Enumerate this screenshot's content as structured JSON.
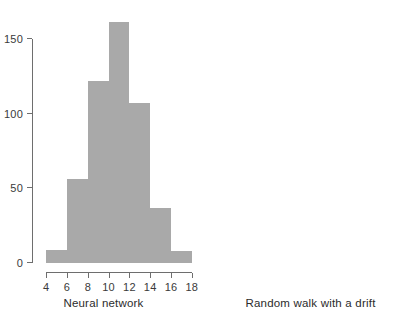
{
  "figure": {
    "background": "#ffffff",
    "bar_color": "#a9a9a9",
    "axis_color": "#6e6e6e",
    "text_color": "#2b2b2b"
  },
  "chart_data": [
    {
      "type": "bar",
      "title": "",
      "xlabel": "Neural network",
      "ylabel": "",
      "panel": "left",
      "xlim": [
        3.4,
        18.6
      ],
      "ylim": [
        0,
        168
      ],
      "grid": false,
      "legend": null,
      "xticks": [
        4,
        6,
        8,
        10,
        12,
        14,
        16,
        18
      ],
      "xtick_labels": [
        "4",
        "6",
        "8",
        "10",
        "12",
        "14",
        "16",
        "18"
      ],
      "yticks": [
        0,
        50,
        100,
        150
      ],
      "ytick_labels": [
        "0",
        "50",
        "100",
        "150"
      ],
      "bin_edges": [
        4,
        6,
        8,
        10,
        12,
        14,
        16,
        18
      ],
      "categories": [
        "4-6",
        "6-8",
        "8-10",
        "10-12",
        "12-14",
        "14-16",
        "16-18"
      ],
      "values": [
        9,
        56,
        122,
        161,
        107,
        37,
        8
      ]
    },
    {
      "type": "bar",
      "title": "",
      "xlabel": "Random walk with a drift",
      "ylabel": "",
      "panel": "right",
      "xlim": [
        4.6,
        17.4
      ],
      "ylim": [
        0,
        128
      ],
      "grid": false,
      "legend": null,
      "xticks": [
        6,
        8,
        10,
        12,
        14,
        16
      ],
      "xtick_labels": [
        "6",
        "8",
        "10",
        "12",
        "14",
        "16"
      ],
      "yticks": [
        0,
        20,
        40,
        60,
        80,
        100,
        120
      ],
      "ytick_labels": [
        "0",
        "20",
        "40",
        "60",
        "80",
        "100",
        "120"
      ],
      "bin_edges": [
        5,
        6,
        7,
        8,
        9,
        10,
        11,
        12,
        13,
        14,
        15,
        16,
        17
      ],
      "categories": [
        "5-6",
        "6-7",
        "7-8",
        "8-9",
        "9-10",
        "10-11",
        "11-12",
        "12-13",
        "13-14",
        "14-15",
        "15-16",
        "16-17"
      ],
      "values": [
        3,
        12,
        39,
        68,
        124,
        120,
        91,
        21,
        15,
        4,
        0,
        2
      ]
    }
  ]
}
